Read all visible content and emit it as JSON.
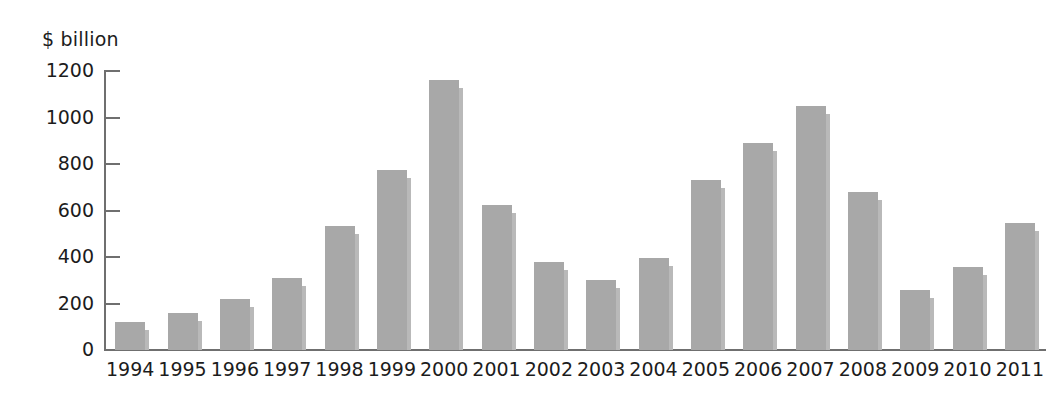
{
  "chart_data": {
    "type": "bar",
    "title": "",
    "subtitle": "",
    "xlabel": "",
    "ylabel": "$ billion",
    "unit_label": "$ billion",
    "categories": [
      "1994",
      "1995",
      "1996",
      "1997",
      "1998",
      "1999",
      "2000",
      "2001",
      "2002",
      "2003",
      "2004",
      "2005",
      "2006",
      "2007",
      "2008",
      "2009",
      "2010",
      "2011"
    ],
    "values": [
      120,
      160,
      220,
      310,
      535,
      775,
      1160,
      625,
      380,
      300,
      395,
      730,
      890,
      1050,
      680,
      260,
      355,
      545
    ],
    "series": [
      {
        "name": "$ billion",
        "values": [
          120,
          160,
          220,
          310,
          535,
          775,
          1160,
          625,
          380,
          300,
          395,
          730,
          890,
          1050,
          680,
          260,
          355,
          545
        ]
      }
    ],
    "ylim": [
      0,
      1200
    ],
    "yticks": [
      0,
      200,
      400,
      600,
      800,
      1000,
      1200
    ],
    "ytick_labels": [
      "0",
      "200",
      "400",
      "600",
      "800",
      "1000",
      "1200"
    ],
    "grid": false,
    "legend": "none",
    "bar_color": "#a8a8a8",
    "bar_shadow_color": "#b9b9b9",
    "axis_color": "#6f6f6f",
    "text_color": "#1c1c1c",
    "background_color": "#ffffff"
  }
}
